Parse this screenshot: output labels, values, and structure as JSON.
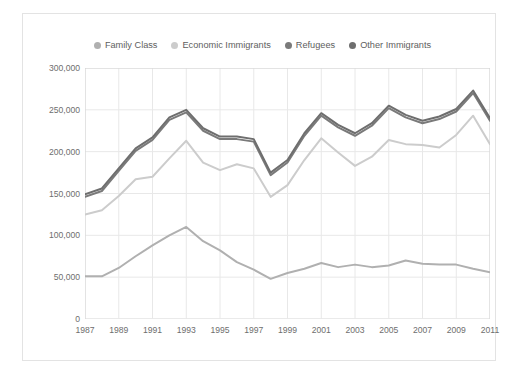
{
  "chart_data": {
    "type": "line",
    "title": "",
    "subtitle": "",
    "xlabel": "",
    "ylabel": "",
    "x": [
      1987,
      1988,
      1989,
      1990,
      1991,
      1992,
      1993,
      1994,
      1995,
      1996,
      1997,
      1998,
      1999,
      2000,
      2001,
      2002,
      2003,
      2004,
      2005,
      2006,
      2007,
      2008,
      2009,
      2010,
      2011
    ],
    "xlim": [
      1987,
      2011
    ],
    "ylim": [
      0,
      300000
    ],
    "yticks": [
      0,
      50000,
      100000,
      150000,
      200000,
      250000,
      300000
    ],
    "ytick_labels": [
      "0",
      "50,000",
      "100,000",
      "150,000",
      "200,000",
      "250,000",
      "300,000"
    ],
    "xtick_values": [
      1987,
      1989,
      1991,
      1993,
      1995,
      1997,
      1999,
      2001,
      2003,
      2005,
      2007,
      2009,
      2011
    ],
    "xtick_labels": [
      "1987",
      "1989",
      "1991",
      "1993",
      "1995",
      "1997",
      "1999",
      "2001",
      "2003",
      "2005",
      "2007",
      "2009",
      "2011"
    ],
    "grid": true,
    "legend_position": "top",
    "series": [
      {
        "name": "Family Class",
        "color": "#b0b0b0",
        "values": [
          51000,
          51000,
          61000,
          75000,
          88000,
          100000,
          110000,
          93000,
          82000,
          68000,
          59000,
          48000,
          55000,
          60000,
          67000,
          62000,
          65000,
          62000,
          64000,
          70000,
          66000,
          65000,
          65000,
          60000,
          56000
        ]
      },
      {
        "name": "Economic Immigrants",
        "color": "#cccccc",
        "values": [
          125000,
          130000,
          147000,
          167000,
          170000,
          192000,
          213000,
          187000,
          178000,
          185000,
          180000,
          146000,
          160000,
          190000,
          216000,
          199000,
          183000,
          194000,
          214000,
          209000,
          208000,
          205000,
          220000,
          243000,
          209000
        ]
      },
      {
        "name": "Refugees",
        "color": "#7a7a7a",
        "values": [
          146000,
          153000,
          177000,
          201000,
          214000,
          238000,
          247000,
          225000,
          215000,
          215000,
          212000,
          172000,
          187000,
          219000,
          243000,
          229000,
          219000,
          231000,
          252000,
          241000,
          234000,
          239000,
          248000,
          270000,
          237000
        ]
      },
      {
        "name": "Other Immigrants",
        "color": "#6e6e6e",
        "values": [
          149000,
          156000,
          180000,
          204000,
          217000,
          241000,
          250000,
          228000,
          218000,
          218000,
          215000,
          175000,
          190000,
          222000,
          246000,
          232000,
          222000,
          234000,
          255000,
          244000,
          237000,
          242000,
          251000,
          273000,
          240000
        ]
      }
    ]
  },
  "legend": {
    "items": [
      {
        "label": "Family Class",
        "color": "#b0b0b0"
      },
      {
        "label": "Economic Immigrants",
        "color": "#cccccc"
      },
      {
        "label": "Refugees",
        "color": "#7a7a7a"
      },
      {
        "label": "Other Immigrants",
        "color": "#6e6e6e"
      }
    ]
  },
  "axes": {
    "grid_color": "#e8e8e8",
    "axis_color": "#d4d4d4",
    "tick_text_color": "#6e6e6e"
  }
}
